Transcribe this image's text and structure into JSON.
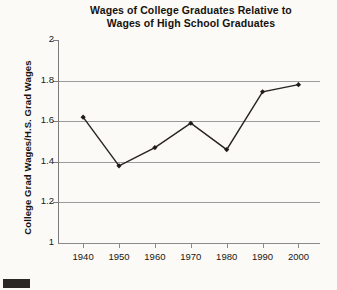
{
  "chart_data": {
    "type": "line",
    "title": "Wages of College Graduates Relative to Wages of High School Graduates",
    "title_lines": [
      "Wages of College Graduates Relative to",
      "Wages of High School Graduates"
    ],
    "xlabel": "",
    "ylabel": "College Grad Wages/H.S. Grad Wages",
    "x": [
      1940,
      1950,
      1960,
      1970,
      1980,
      1990,
      2000
    ],
    "values": [
      1.62,
      1.38,
      1.47,
      1.59,
      1.46,
      1.745,
      1.78
    ],
    "xtick_labels": [
      "1940",
      "1950",
      "1960",
      "1970",
      "1980",
      "1990",
      "2000"
    ],
    "ytick_labels": [
      "1",
      "1.2",
      "1.4",
      "1.6",
      "1.8",
      "2"
    ],
    "yticks": [
      1,
      1.2,
      1.4,
      1.6,
      1.8,
      2
    ],
    "ylim": [
      1,
      2
    ],
    "xlim": [
      1933,
      2006
    ],
    "grid": true,
    "legend": false,
    "marker": "diamond",
    "line_color": "#262220",
    "marker_color": "#201c1a",
    "grid_color": "#9b9b9b",
    "background_color": "#fbfaf6"
  }
}
